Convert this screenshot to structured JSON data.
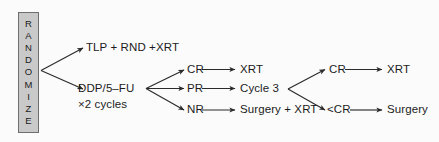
{
  "figure": {
    "background_color": "#fbfbfb",
    "line_color": "#2b2b2b",
    "text_color": "#1b1b1b"
  },
  "randomize": {
    "label": "RANDOMIZE",
    "letters": [
      "R",
      "A",
      "N",
      "D",
      "O",
      "M",
      "I",
      "Z",
      "E"
    ],
    "fill_color": "#c9c9c9",
    "border_color": "#6e6e6e"
  },
  "nodes": {
    "arm_a": "TLP + RND +XRT",
    "arm_b_line1": "DDP/5–FU",
    "arm_b_line2": "×2 cycles",
    "response_cr": "CR",
    "response_pr": "PR",
    "response_nr": "NR",
    "cr_outcome": "XRT",
    "pr_outcome": "Cycle 3",
    "nr_outcome": "Surgery + XRT",
    "second_cr": "CR",
    "second_lt_cr": "<CR",
    "second_cr_outcome": "XRT",
    "second_lt_cr_outcome": "Surgery"
  },
  "edges": [
    {
      "from": "randomize",
      "to": "arm_a"
    },
    {
      "from": "randomize",
      "to": "arm_b"
    },
    {
      "from": "arm_b",
      "to": "response_cr"
    },
    {
      "from": "arm_b",
      "to": "response_pr"
    },
    {
      "from": "arm_b",
      "to": "response_nr"
    },
    {
      "from": "response_cr",
      "to": "cr_outcome"
    },
    {
      "from": "response_pr",
      "to": "pr_outcome"
    },
    {
      "from": "response_nr",
      "to": "nr_outcome"
    },
    {
      "from": "pr_outcome",
      "to": "second_cr"
    },
    {
      "from": "pr_outcome",
      "to": "second_lt_cr"
    },
    {
      "from": "second_cr",
      "to": "second_cr_outcome"
    },
    {
      "from": "second_lt_cr",
      "to": "second_lt_cr_outcome"
    }
  ]
}
